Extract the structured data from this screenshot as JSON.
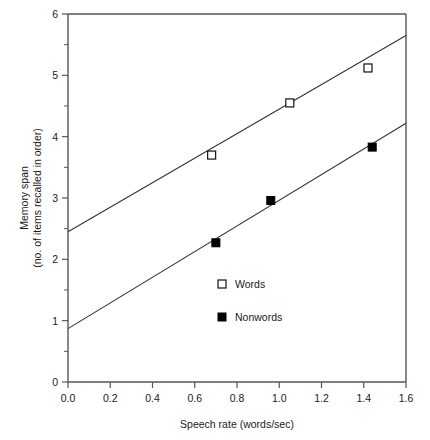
{
  "chart_data": {
    "type": "scatter",
    "title": "",
    "xlabel": "Speech rate (words/sec)",
    "ylabel_line1": "Memory span",
    "ylabel_line2": "(no. of items recalled in order)",
    "xlim": [
      0.0,
      1.6
    ],
    "ylim": [
      0,
      6
    ],
    "xticks": [
      "0.0",
      "0.2",
      "0.4",
      "0.6",
      "0.8",
      "1.0",
      "1.2",
      "1.4",
      "1.6"
    ],
    "xtick_values": [
      0.0,
      0.2,
      0.4,
      0.6,
      0.8,
      1.0,
      1.2,
      1.4,
      1.6
    ],
    "yticks": [
      "0",
      "1",
      "2",
      "3",
      "4",
      "5",
      "6"
    ],
    "ytick_values": [
      0,
      1,
      2,
      3,
      4,
      5,
      6
    ],
    "y_minor_values": [
      0.5,
      1.5,
      2.5,
      3.5,
      4.5,
      5.5
    ],
    "grid": false,
    "legend_position": "center-right-inside",
    "series": [
      {
        "name": "Words",
        "marker": "open-square",
        "points": [
          {
            "x": 0.68,
            "y": 3.7
          },
          {
            "x": 1.05,
            "y": 4.55
          },
          {
            "x": 1.42,
            "y": 5.12
          }
        ],
        "fit_line": {
          "x0": 0.0,
          "y0": 2.45,
          "x1": 1.6,
          "y1": 5.65
        }
      },
      {
        "name": "Nonwords",
        "marker": "filled-square",
        "points": [
          {
            "x": 0.7,
            "y": 2.27
          },
          {
            "x": 0.96,
            "y": 2.96
          },
          {
            "x": 1.44,
            "y": 3.83
          }
        ],
        "fit_line": {
          "x0": 0.0,
          "y0": 0.87,
          "x1": 1.6,
          "y1": 4.22
        }
      }
    ]
  },
  "legend": {
    "entries": [
      {
        "label": "Words",
        "marker": "open-square"
      },
      {
        "label": "Nonwords",
        "marker": "filled-square"
      }
    ]
  },
  "axes": {
    "x_title": "Speech rate (words/sec)",
    "y_title_line1": "Memory span",
    "y_title_line2": "(no. of items recalled in order)"
  },
  "colors": {
    "axis": "#555555",
    "line": "#333333",
    "marker_fill": "#000000",
    "marker_open_fill": "#ffffff",
    "text": "#1a1a1a",
    "background": "#ffffff"
  }
}
